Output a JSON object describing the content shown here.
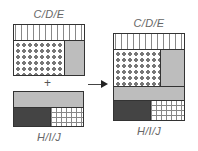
{
  "left_top": {
    "label": "C/D/E",
    "sections": [
      "plus-pattern",
      "dot-pattern",
      "gray"
    ]
  },
  "plus_sign": "+",
  "left_bottom": {
    "label": "H/I/J",
    "sections": [
      "gray",
      "dark",
      "grid-pattern"
    ]
  },
  "arrow": "right-arrow",
  "result": {
    "top_label": "C/D/E",
    "bottom_label": "H/I/J",
    "sections": [
      "plus-pattern",
      "dot-pattern",
      "gray",
      "gray-band",
      "dark",
      "grid-pattern"
    ]
  },
  "colors": {
    "border": "#333333",
    "gray": "#bdbdbd",
    "dark": "#444444",
    "pattern": "#888888"
  }
}
